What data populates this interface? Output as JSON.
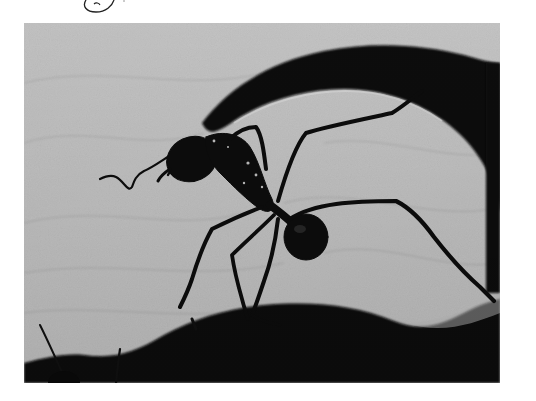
{
  "image": {
    "subject": "ant on leaf",
    "style": "black-and-white macro photograph",
    "border_color": "#ffffff",
    "colors": {
      "leaf_light": "#c9c9c9",
      "leaf_mid": "#a8a8a8",
      "shadow": "#0a0a0a"
    }
  },
  "annotation": {
    "type": "handwritten circle mark",
    "position": "top-left above photo"
  }
}
